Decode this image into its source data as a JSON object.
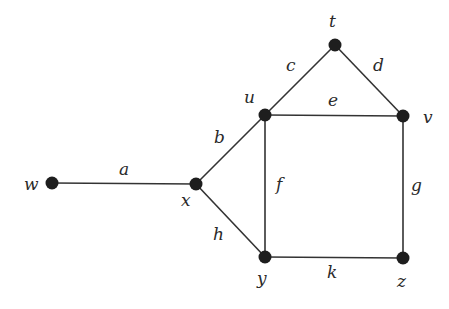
{
  "diagram": {
    "type": "undirected-graph",
    "colors": {
      "edge": "#333333",
      "node": "#1e1e1e",
      "label": "#2a2a2a",
      "background": "#ffffff"
    },
    "nodes": [
      {
        "id": "t",
        "label": "t",
        "x": 335,
        "y": 45,
        "lx": 329,
        "ly": 27
      },
      {
        "id": "u",
        "label": "u",
        "x": 265,
        "y": 115,
        "lx": 244,
        "ly": 103
      },
      {
        "id": "v",
        "label": "v",
        "x": 403,
        "y": 116,
        "lx": 423,
        "ly": 123
      },
      {
        "id": "w",
        "label": "w",
        "x": 52,
        "y": 183,
        "lx": 24,
        "ly": 190
      },
      {
        "id": "x",
        "label": "x",
        "x": 196,
        "y": 184,
        "lx": 181,
        "ly": 206
      },
      {
        "id": "y",
        "label": "y",
        "x": 265,
        "y": 257,
        "lx": 257,
        "ly": 284
      },
      {
        "id": "z",
        "label": "z",
        "x": 403,
        "y": 258,
        "lx": 397,
        "ly": 287
      }
    ],
    "edges": [
      {
        "id": "a",
        "label": "a",
        "from": "w",
        "to": "x",
        "lx": 119,
        "ly": 175
      },
      {
        "id": "b",
        "label": "b",
        "from": "x",
        "to": "u",
        "lx": 214,
        "ly": 143
      },
      {
        "id": "c",
        "label": "c",
        "from": "u",
        "to": "t",
        "lx": 286,
        "ly": 71
      },
      {
        "id": "d",
        "label": "d",
        "from": "t",
        "to": "v",
        "lx": 373,
        "ly": 71
      },
      {
        "id": "e",
        "label": "e",
        "from": "u",
        "to": "v",
        "lx": 328,
        "ly": 106
      },
      {
        "id": "f",
        "label": "f",
        "from": "u",
        "to": "y",
        "lx": 276,
        "ly": 190
      },
      {
        "id": "g",
        "label": "g",
        "from": "v",
        "to": "z",
        "lx": 411,
        "ly": 191
      },
      {
        "id": "h",
        "label": "h",
        "from": "x",
        "to": "y",
        "lx": 213,
        "ly": 240
      },
      {
        "id": "k",
        "label": "k",
        "from": "y",
        "to": "z",
        "lx": 327,
        "ly": 278
      }
    ]
  }
}
